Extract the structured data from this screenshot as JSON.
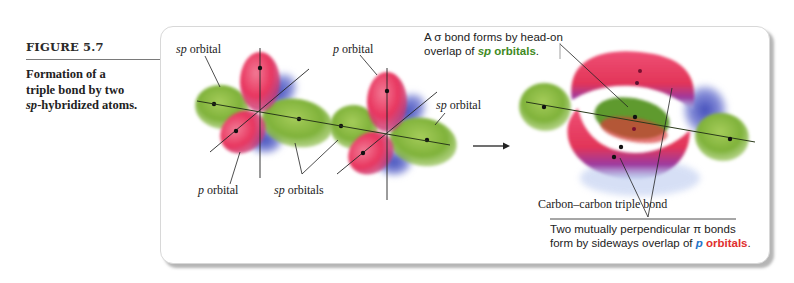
{
  "figure": {
    "number": "FIGURE 5.7",
    "description_parts": [
      "Formation of a",
      "triple bond by two",
      "sp",
      "-hybridized atoms."
    ]
  },
  "labels": {
    "atom1_sp_orbital": {
      "prefix": "sp",
      "suffix": " orbital"
    },
    "atom1_p_orbital": {
      "prefix": "p",
      "suffix": " orbital"
    },
    "shared_sp_orbitals": {
      "prefix": "sp",
      "suffix": " orbitals"
    },
    "atom2_p_orbital": {
      "prefix": "p",
      "suffix": " orbital"
    },
    "atom2_sp_orbital": {
      "prefix": "sp",
      "suffix": " orbital"
    },
    "triple_bond": "Carbon–carbon triple bond"
  },
  "sigma_note": {
    "line1": "A σ bond forms by head-on",
    "line2_prefix": "overlap of ",
    "line2_sp": "sp",
    "line2_orbitals": " orbitals",
    "line2_end": "."
  },
  "pi_note": {
    "line1": "Two mutually perpendicular π bonds",
    "line2_prefix": "form by sideways overlap of ",
    "line2_p": "p",
    "line2_orbitals": " orbitals",
    "line2_end": "."
  },
  "colors": {
    "sp_orbital_green": "#7fb23a",
    "p_orbital_red": "#e8365f",
    "p_orbital_blue": "#5a63c9",
    "sigma_text_green": "#3f8a1e",
    "p_text_blue": "#1f74c9",
    "orbitals_text_red": "#e0302f"
  },
  "arrow": {
    "direction": "right"
  }
}
